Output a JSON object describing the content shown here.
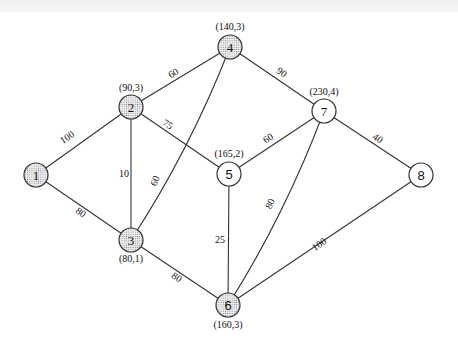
{
  "diagram": {
    "type": "weighted-graph",
    "nodes": [
      {
        "id": "1",
        "label": "1",
        "x": 36,
        "y": 175,
        "shaded": true,
        "coord": ""
      },
      {
        "id": "2",
        "label": "2",
        "x": 131,
        "y": 107,
        "shaded": true,
        "coord": "(90,3)"
      },
      {
        "id": "3",
        "label": "3",
        "x": 131,
        "y": 240,
        "shaded": true,
        "coord": "(80,1)"
      },
      {
        "id": "4",
        "label": "4",
        "x": 230,
        "y": 47,
        "shaded": true,
        "coord": "(140,3)"
      },
      {
        "id": "5",
        "label": "5",
        "x": 229,
        "y": 174,
        "shaded": false,
        "coord": "(165,2)"
      },
      {
        "id": "6",
        "label": "6",
        "x": 228,
        "y": 305,
        "shaded": true,
        "coord": "(160,3)"
      },
      {
        "id": "7",
        "label": "7",
        "x": 324,
        "y": 111,
        "shaded": false,
        "coord": "(230,4)"
      },
      {
        "id": "8",
        "label": "8",
        "x": 421,
        "y": 175,
        "shaded": false,
        "coord": ""
      }
    ],
    "edges": [
      {
        "from": "1",
        "to": "2",
        "weight": "100"
      },
      {
        "from": "1",
        "to": "3",
        "weight": "80"
      },
      {
        "from": "2",
        "to": "3",
        "weight": "10"
      },
      {
        "from": "2",
        "to": "4",
        "weight": "60"
      },
      {
        "from": "2",
        "to": "5",
        "weight": "75"
      },
      {
        "from": "3",
        "to": "4",
        "weight": "60"
      },
      {
        "from": "3",
        "to": "6",
        "weight": "80"
      },
      {
        "from": "4",
        "to": "7",
        "weight": "90"
      },
      {
        "from": "5",
        "to": "7",
        "weight": "60"
      },
      {
        "from": "5",
        "to": "6",
        "weight": "25"
      },
      {
        "from": "6",
        "to": "7",
        "weight": "80"
      },
      {
        "from": "6",
        "to": "8",
        "weight": "100"
      },
      {
        "from": "7",
        "to": "8",
        "weight": "40"
      }
    ]
  },
  "labels": {
    "n1": "1",
    "n2": "2",
    "n3": "3",
    "n4": "4",
    "n5": "5",
    "n6": "6",
    "n7": "7",
    "n8": "8",
    "c2": "(90,3)",
    "c3": "(80,1)",
    "c4": "(140,3)",
    "c5": "(165,2)",
    "c6": "(160,3)",
    "c7": "(230,4)",
    "w12": "100",
    "w13": "80",
    "w23": "10",
    "w24": "60",
    "w25": "75",
    "w34": "60",
    "w36": "80",
    "w47": "90",
    "w57": "60",
    "w56": "25",
    "w67": "80",
    "w68": "100",
    "w78": "40"
  }
}
